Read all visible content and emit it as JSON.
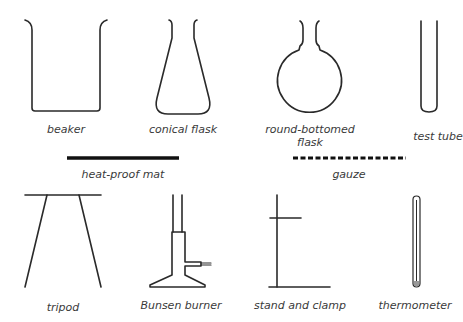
{
  "diagram": {
    "title": "",
    "colors": {
      "stroke": "#2a2a2a",
      "text": "#3a3a3a",
      "background": "#ffffff"
    },
    "items": [
      {
        "id": "beaker",
        "label": "beaker"
      },
      {
        "id": "conical-flask",
        "label": "conical flask"
      },
      {
        "id": "round-bottomed-flask",
        "label_line1": "round-bottomed",
        "label_line2": "flask"
      },
      {
        "id": "test-tube",
        "label": "test tube"
      },
      {
        "id": "heat-proof-mat",
        "label": "heat-proof mat"
      },
      {
        "id": "gauze",
        "label": "gauze"
      },
      {
        "id": "tripod",
        "label": "tripod"
      },
      {
        "id": "bunsen-burner",
        "label": "Bunsen burner"
      },
      {
        "id": "stand-and-clamp",
        "label": "stand and clamp"
      },
      {
        "id": "thermometer",
        "label": "thermometer"
      }
    ]
  }
}
